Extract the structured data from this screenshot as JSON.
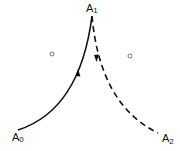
{
  "diagram": {
    "points": {
      "A0": {
        "label": "A",
        "subscript": "0"
      },
      "A1": {
        "label": "A",
        "subscript": "1"
      },
      "A2": {
        "label": "A",
        "subscript": "2"
      }
    },
    "curves": [
      {
        "name": "solid-arc",
        "from": "A0",
        "to": "A1",
        "style": "solid",
        "arrow_direction": "toward A1"
      },
      {
        "name": "dashed-arc",
        "from": "A1",
        "to": "A2",
        "style": "dashed",
        "arrow_direction": "toward A2"
      }
    ],
    "centers": [
      {
        "name": "left-center",
        "marker": "small circle"
      },
      {
        "name": "right-center",
        "marker": "small circle"
      }
    ],
    "colors": {
      "ink": "#111111",
      "marker": "#777777",
      "background": "#ffffff"
    }
  }
}
